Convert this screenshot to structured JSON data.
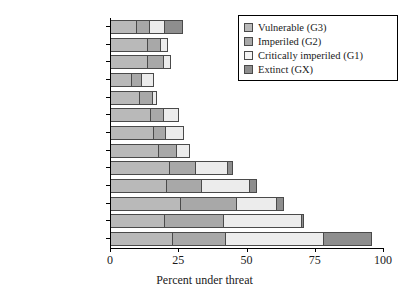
{
  "chart_data": {
    "type": "bar",
    "orientation": "horizontal",
    "stacked": true,
    "title": "",
    "xlabel": "Percent under threat",
    "ylabel": "",
    "xlim": [
      0,
      100
    ],
    "xticks": [
      0,
      25,
      50,
      75,
      100
    ],
    "xtick_labels": [
      "0",
      "25",
      "50",
      "75",
      "100"
    ],
    "grid": false,
    "legend_position": "top-right",
    "categories": [
      "Birds",
      "Mammals",
      "Butterflies",
      "Reptiles",
      "Dragonflies",
      "Tiger beetles",
      "Ferns",
      "Conifers",
      "Flowering plants",
      "Freshwater fishes",
      "Amphibians",
      "Crayfishes",
      "Freshwater mussels"
    ],
    "series": [
      {
        "name": "Vulnerable (G3)",
        "key": "g3",
        "color": "#b9b9b9",
        "values": [
          10,
          14,
          14,
          8,
          11,
          15,
          16,
          18,
          22,
          21,
          26,
          20,
          23
        ]
      },
      {
        "name": "Imperiled (G2)",
        "key": "g2",
        "color": "#a8a8a8",
        "values": [
          5,
          5,
          6,
          4,
          5,
          5,
          5,
          7,
          10,
          13,
          21,
          22,
          20
        ]
      },
      {
        "name": "Critically imperiled (G1)",
        "key": "g1",
        "color": "#ececec",
        "values": [
          6,
          3,
          3,
          5,
          2,
          6,
          7,
          5,
          12,
          18,
          15,
          29,
          36
        ]
      },
      {
        "name": "Extinct (GX)",
        "key": "gx",
        "color": "#8e8e8e",
        "values": [
          7,
          0,
          0,
          0,
          0,
          0,
          0,
          0,
          2,
          3,
          3,
          1,
          18
        ]
      }
    ],
    "totals": [
      28,
      22,
      23,
      17,
      18,
      26,
      28,
      30,
      46,
      55,
      65,
      72,
      97
    ]
  },
  "legend": {
    "items": [
      {
        "label": "Vulnerable (G3)",
        "key": "g3"
      },
      {
        "label": "Imperiled (G2)",
        "key": "g2"
      },
      {
        "label": "Critically imperiled (G1)",
        "key": "g1"
      },
      {
        "label": "Extinct (GX)",
        "key": "gx"
      }
    ]
  }
}
